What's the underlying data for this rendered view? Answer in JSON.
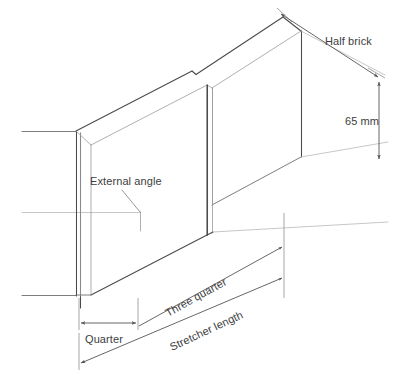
{
  "diagram": {
    "background_color": "#ffffff",
    "line_color_dark": "#4a4a4a",
    "line_color_light": "#9b9b9b",
    "text_color": "#3d3d3d",
    "labels": {
      "half_brick": "Half brick",
      "height": "65 mm",
      "external_angle": "External angle",
      "quarter": "Quarter",
      "three_quarter": "Three quarter",
      "stretcher_length": "Stretcher length"
    },
    "dimensions": [
      {
        "name": "half-brick",
        "label": "Half brick",
        "orientation": "oblique",
        "arrows": "double"
      },
      {
        "name": "brick-height",
        "label": "65 mm",
        "orientation": "vertical",
        "arrows": "double"
      },
      {
        "name": "quarter-width",
        "label": "Quarter",
        "orientation": "horizontal",
        "arrows": "double"
      },
      {
        "name": "three-quarter-length",
        "label": "Three quarter",
        "orientation": "oblique",
        "arrows": "single"
      },
      {
        "name": "stretcher-length",
        "label": "Stretcher length",
        "orientation": "oblique",
        "arrows": "single"
      }
    ],
    "annotations": [
      {
        "name": "external-angle",
        "label": "External angle",
        "leader": "true"
      }
    ]
  }
}
